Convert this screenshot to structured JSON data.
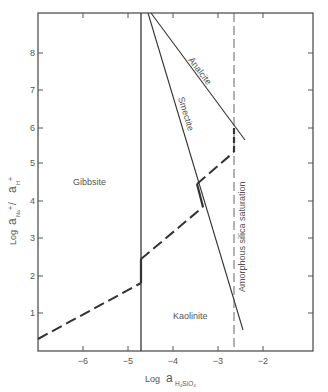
{
  "diagram": {
    "type": "stability-diagram",
    "x_axis": {
      "label_prefix": "Log",
      "label_symbol": "a",
      "label_subscript": "H₄SiO₄",
      "ticks": [
        "−6",
        "−5",
        "−4",
        "−3",
        "−2"
      ],
      "tick_values": [
        -6,
        -5,
        -4,
        -3,
        -2
      ],
      "range": [
        -7,
        -0.9
      ]
    },
    "y_axis": {
      "label_prefix": "Log",
      "label_expr": "a",
      "label_sub1": "Na",
      "label_sup1": "+",
      "label_sep": " / ",
      "label_expr2": "a",
      "label_sub2": "H",
      "label_sup2": "+",
      "ticks": [
        "1",
        "2",
        "3",
        "4",
        "5",
        "6",
        "7",
        "8"
      ],
      "tick_values": [
        1,
        2,
        3,
        4,
        5,
        6,
        7,
        8
      ],
      "range": [
        0,
        9
      ]
    },
    "fields": {
      "gibbsite": "Gibbsite",
      "kaolinite": "Kaolinite"
    },
    "boundary_labels": {
      "analcite": "Analcite",
      "smectite": "Smectite",
      "amorphous_silica": "Amorphous silica saturation"
    },
    "colors": {
      "line": "#333333",
      "frame": "#444444",
      "text": "#555555"
    }
  }
}
